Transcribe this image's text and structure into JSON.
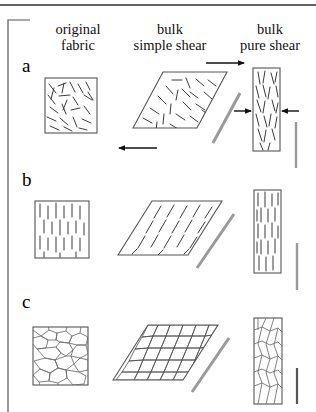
{
  "figure": {
    "top_rule": true,
    "frame_color": "#555555",
    "background": "#ffffff",
    "line_color": "#3a3a3a",
    "grain_color": "#6b6b6b",
    "shear_marker_color": "#9a9a9a",
    "arrow_color": "#111111",
    "width": 316,
    "height": 412
  },
  "columns": [
    {
      "id": "original-fabric",
      "line1": "original",
      "line2": "fabric"
    },
    {
      "id": "bulk-simple-shear",
      "line1": "bulk",
      "line2": "simple shear"
    },
    {
      "id": "bulk-pure-shear",
      "line1": "bulk",
      "line2": "pure shear"
    }
  ],
  "rows": [
    {
      "id": "row-a",
      "label": "a",
      "fabric": "random-oriented-segments",
      "description": "randomly oriented line segments, no preferred fabric"
    },
    {
      "id": "row-b",
      "label": "b",
      "fabric": "vertical-aligned-segments",
      "description": "strong vertical preferred orientation of segments"
    },
    {
      "id": "row-c",
      "label": "c",
      "fabric": "polygonal-grain-network",
      "description": "polygonal grain boundary network / foam texture"
    }
  ],
  "annotations": {
    "simple_shear_top_arrow": "top-dextral-arrow",
    "simple_shear_bottom_arrow": "bottom-sinistral-arrow",
    "pure_shear_left_arrow": "left-inward-arrow",
    "pure_shear_right_arrow": "right-inward-arrow",
    "scale_bar": "vertical-grey-scale-bar",
    "shear_line": "grey-shear-plane-line"
  }
}
